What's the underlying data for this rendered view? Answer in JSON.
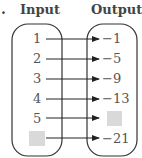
{
  "label_marker": ".",
  "headers": {
    "input": "Input",
    "output": "Output"
  },
  "rows": [
    {
      "input": "1",
      "output": "−1",
      "input_blank": false,
      "output_blank": false
    },
    {
      "input": "2",
      "output": "−5",
      "input_blank": false,
      "output_blank": false
    },
    {
      "input": "3",
      "output": "−9",
      "input_blank": false,
      "output_blank": false
    },
    {
      "input": "4",
      "output": "−13",
      "input_blank": false,
      "output_blank": false
    },
    {
      "input": "5",
      "output": "",
      "input_blank": false,
      "output_blank": true
    },
    {
      "input": "",
      "output": "−21",
      "input_blank": true,
      "output_blank": false
    }
  ],
  "colors": {
    "oval": "#333333",
    "arrow": "#222222",
    "blank": "#d9d9d9",
    "text": "#555555"
  }
}
